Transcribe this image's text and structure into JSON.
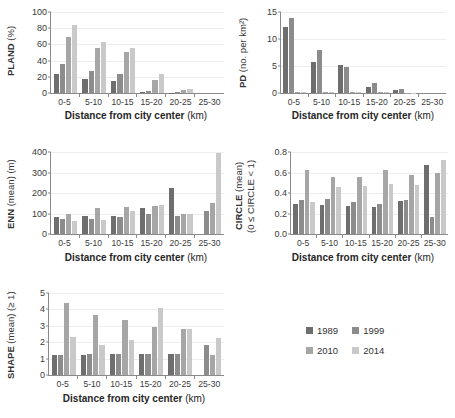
{
  "legend": {
    "position": "bottom-right",
    "entries": [
      {
        "label": "1989",
        "color": "#6e6e6e"
      },
      {
        "label": "1999",
        "color": "#8c8c8c"
      },
      {
        "label": "2010",
        "color": "#a6a6a6"
      },
      {
        "label": "2014",
        "color": "#c9c9c9"
      }
    ]
  },
  "xaxis": {
    "title_bold": "Distance from city center",
    "title_unit": "(km)",
    "categories": [
      "0-5",
      "5-10",
      "10-15",
      "15-20",
      "20-25",
      "25-30"
    ]
  },
  "chart_data": [
    {
      "type": "bar",
      "id": "pland",
      "title": "",
      "ylabel_bold": "PLAND",
      "ylabel_unit": "(%)",
      "xlabel": "Distance from city center (km)",
      "categories": [
        "0-5",
        "5-10",
        "10-15",
        "15-20",
        "20-25",
        "25-30"
      ],
      "ylim": [
        0,
        100
      ],
      "yticks": [
        0,
        20,
        40,
        60,
        80,
        100
      ],
      "grid": true,
      "series": [
        {
          "name": "1989",
          "color": "#6e6e6e",
          "values": [
            23.5,
            17.5,
            14.5,
            1.0,
            0.4,
            0.0
          ]
        },
        {
          "name": "1999",
          "color": "#8c8c8c",
          "values": [
            36.0,
            27.5,
            23.5,
            2.0,
            0.8,
            0.0
          ]
        },
        {
          "name": "2010",
          "color": "#a6a6a6",
          "values": [
            69.0,
            55.5,
            51.0,
            16.5,
            3.5,
            0.0
          ]
        },
        {
          "name": "2014",
          "color": "#c9c9c9",
          "values": [
            83.5,
            63.5,
            55.0,
            23.5,
            5.0,
            0.0
          ]
        }
      ]
    },
    {
      "type": "bar",
      "id": "pd",
      "ylabel_bold": "PD",
      "ylabel_unit": "(no. per km²)",
      "xlabel": "Distance from city center (km)",
      "categories": [
        "0-5",
        "5-10",
        "10-15",
        "15-20",
        "20-25",
        "25-30"
      ],
      "ylim": [
        0,
        15
      ],
      "yticks": [
        0,
        5,
        10,
        15
      ],
      "grid": true,
      "series": [
        {
          "name": "1989",
          "color": "#6e6e6e",
          "values": [
            12.2,
            5.7,
            5.2,
            1.2,
            0.6,
            0.0
          ]
        },
        {
          "name": "1999",
          "color": "#8c8c8c",
          "values": [
            13.8,
            7.9,
            4.9,
            1.8,
            0.8,
            0.0
          ]
        },
        {
          "name": "2010",
          "color": "#a6a6a6",
          "values": [
            0.1,
            0.15,
            0.2,
            0.15,
            0.05,
            0.0
          ]
        },
        {
          "name": "2014",
          "color": "#c9c9c9",
          "values": [
            0.15,
            0.25,
            0.2,
            0.15,
            0.05,
            0.0
          ]
        }
      ]
    },
    {
      "type": "bar",
      "id": "enn",
      "ylabel_bold": "ENN",
      "ylabel_unit": "(mean) (m)",
      "xlabel": "Distance from city center (km)",
      "categories": [
        "0-5",
        "5-10",
        "10-15",
        "15-20",
        "20-25",
        "25-30"
      ],
      "ylim": [
        0,
        400
      ],
      "yticks": [
        0,
        100,
        200,
        300,
        400
      ],
      "grid": true,
      "series": [
        {
          "name": "1989",
          "color": "#6e6e6e",
          "values": [
            84,
            90,
            87,
            128,
            224,
            0
          ]
        },
        {
          "name": "1999",
          "color": "#8c8c8c",
          "values": [
            72,
            75,
            82,
            97,
            90,
            114
          ]
        },
        {
          "name": "2010",
          "color": "#a6a6a6",
          "values": [
            98,
            128,
            131,
            136,
            97,
            151
          ]
        },
        {
          "name": "2014",
          "color": "#c9c9c9",
          "values": [
            65,
            68,
            112,
            142,
            99,
            396
          ]
        }
      ]
    },
    {
      "type": "bar",
      "id": "circle",
      "ylabel_bold": "CIRCLE",
      "ylabel_unit": "(mean)",
      "ylabel_line2": "(0 ≤ CIRCLE < 1)",
      "xlabel": "Distance from city center (km)",
      "categories": [
        "0-5",
        "5-10",
        "10-15",
        "15-20",
        "20-25",
        "25-30"
      ],
      "ylim": [
        0,
        0.8
      ],
      "yticks": [
        0.0,
        0.2,
        0.4,
        0.6,
        0.8
      ],
      "ytick_labels": [
        "0.0",
        "0.2",
        "0.4",
        "0.6",
        "0.8"
      ],
      "grid": true,
      "series": [
        {
          "name": "1989",
          "color": "#6e6e6e",
          "values": [
            0.295,
            0.285,
            0.275,
            0.26,
            0.325,
            0.675
          ]
        },
        {
          "name": "1999",
          "color": "#8c8c8c",
          "values": [
            0.33,
            0.34,
            0.315,
            0.295,
            0.33,
            0.17
          ]
        },
        {
          "name": "2010",
          "color": "#a6a6a6",
          "values": [
            0.62,
            0.56,
            0.56,
            0.62,
            0.58,
            0.595
          ]
        },
        {
          "name": "2014",
          "color": "#c9c9c9",
          "values": [
            0.315,
            0.46,
            0.47,
            0.485,
            0.48,
            0.72
          ]
        }
      ]
    },
    {
      "type": "bar",
      "id": "shape",
      "ylabel_bold": "SHAPE",
      "ylabel_unit": "(mean) (≥ 1)",
      "xlabel": "Distance from city center (km)",
      "categories": [
        "0-5",
        "5-10",
        "10-15",
        "15-20",
        "20-25",
        "25-30"
      ],
      "ylim": [
        0,
        5
      ],
      "yticks": [
        0,
        1,
        2,
        3,
        4,
        5
      ],
      "grid": true,
      "series": [
        {
          "name": "1989",
          "color": "#6e6e6e",
          "values": [
            1.25,
            1.22,
            1.27,
            1.27,
            1.28,
            0.0
          ]
        },
        {
          "name": "1999",
          "color": "#8c8c8c",
          "values": [
            1.25,
            1.29,
            1.27,
            1.27,
            1.28,
            1.84
          ]
        },
        {
          "name": "2010",
          "color": "#a6a6a6",
          "values": [
            4.4,
            3.67,
            3.38,
            2.93,
            2.8,
            1.2
          ]
        },
        {
          "name": "2014",
          "color": "#c9c9c9",
          "values": [
            2.3,
            1.81,
            2.12,
            4.1,
            2.78,
            2.27
          ]
        }
      ]
    }
  ]
}
